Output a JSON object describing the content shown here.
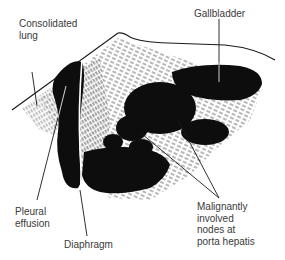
{
  "figure": {
    "type": "ultrasound-illustration",
    "colors": {
      "ink": "#0d0d0d",
      "label": "#3a3a3a",
      "background": "#ffffff"
    }
  },
  "labels": {
    "consolidated_lung": "Consolidated\nlung",
    "gallbladder": "Gallbladder",
    "pleural_effusion": "Pleural\neffusion",
    "diaphragm": "Diaphragm",
    "malignant_nodes": "Malignantly\ninvolved\nnodes at\nporta hepatis"
  }
}
